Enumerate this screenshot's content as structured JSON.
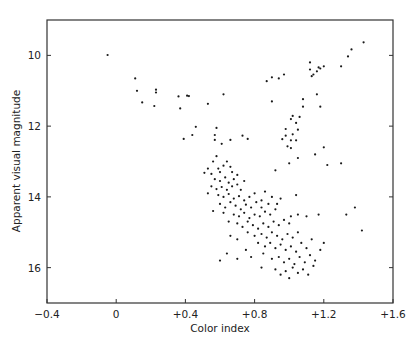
{
  "chart_data": {
    "type": "scatter",
    "title": "",
    "xlabel": "Color index",
    "ylabel": "Apparent visual magnitude",
    "xlim": [
      -0.4,
      1.6
    ],
    "ylim": [
      17.0,
      9.0
    ],
    "y_inverted": true,
    "grid": false,
    "legend": null,
    "x_ticks": [
      -0.4,
      0,
      0.4,
      0.8,
      1.2,
      1.6
    ],
    "x_tick_labels": [
      "−0.4",
      "0",
      "+0.4",
      "+0.8",
      "+1.2",
      "+1.6"
    ],
    "y_ticks": [
      10,
      12,
      14,
      16
    ],
    "y_tick_labels": [
      "10",
      "12",
      "14",
      "16"
    ],
    "marker_color": "#1a1a1a",
    "axis_color": "#333333",
    "points": [
      [
        -0.05,
        9.99
      ],
      [
        0.11,
        10.65
      ],
      [
        0.12,
        11.0
      ],
      [
        0.15,
        11.33
      ],
      [
        0.23,
        10.97
      ],
      [
        0.23,
        11.05
      ],
      [
        0.22,
        11.43
      ],
      [
        0.36,
        11.16
      ],
      [
        0.41,
        11.14
      ],
      [
        0.37,
        11.5
      ],
      [
        0.42,
        11.15
      ],
      [
        0.53,
        11.37
      ],
      [
        0.62,
        11.1
      ],
      [
        0.87,
        10.73
      ],
      [
        0.9,
        10.62
      ],
      [
        0.94,
        10.65
      ],
      [
        0.97,
        10.54
      ],
      [
        0.9,
        11.3
      ],
      [
        0.46,
        12.02
      ],
      [
        0.58,
        12.05
      ],
      [
        0.57,
        12.25
      ],
      [
        0.39,
        12.36
      ],
      [
        0.57,
        12.39
      ],
      [
        0.61,
        12.5
      ],
      [
        0.66,
        12.39
      ],
      [
        0.73,
        12.27
      ],
      [
        0.76,
        12.36
      ],
      [
        0.98,
        12.27
      ],
      [
        1.43,
        9.63
      ],
      [
        1.36,
        9.83
      ],
      [
        1.34,
        10.03
      ],
      [
        1.17,
        10.34
      ],
      [
        1.3,
        10.31
      ],
      [
        1.2,
        10.31
      ],
      [
        1.12,
        10.2
      ],
      [
        1.18,
        10.37
      ],
      [
        1.12,
        10.4
      ],
      [
        1.16,
        10.45
      ],
      [
        1.14,
        10.54
      ],
      [
        1.13,
        10.59
      ],
      [
        1.08,
        11.24
      ],
      [
        1.16,
        11.1
      ],
      [
        1.08,
        11.45
      ],
      [
        1.18,
        11.45
      ],
      [
        1.02,
        11.71
      ],
      [
        1.06,
        11.74
      ],
      [
        1.01,
        11.8
      ],
      [
        1.04,
        11.91
      ],
      [
        0.98,
        12.08
      ],
      [
        1.05,
        12.1
      ],
      [
        1.02,
        12.23
      ],
      [
        0.96,
        12.37
      ],
      [
        1.01,
        12.4
      ],
      [
        1.04,
        12.4
      ],
      [
        0.99,
        12.57
      ],
      [
        1.01,
        12.62
      ],
      [
        1.15,
        12.8
      ],
      [
        1.2,
        12.6
      ],
      [
        1.22,
        13.1
      ],
      [
        1.3,
        13.05
      ],
      [
        1.05,
        12.9
      ],
      [
        1.0,
        13.05
      ],
      [
        0.92,
        13.25
      ],
      [
        0.44,
        12.25
      ],
      [
        0.58,
        12.85
      ],
      [
        0.56,
        13.0
      ],
      [
        0.53,
        13.2
      ],
      [
        0.51,
        13.32
      ],
      [
        0.55,
        13.35
      ],
      [
        0.59,
        13.2
      ],
      [
        0.6,
        13.3
      ],
      [
        0.62,
        13.12
      ],
      [
        0.64,
        13.0
      ],
      [
        0.66,
        13.15
      ],
      [
        0.67,
        13.3
      ],
      [
        0.57,
        13.5
      ],
      [
        0.6,
        13.55
      ],
      [
        0.63,
        13.45
      ],
      [
        0.65,
        13.6
      ],
      [
        0.68,
        13.5
      ],
      [
        0.7,
        13.38
      ],
      [
        0.55,
        13.7
      ],
      [
        0.58,
        13.78
      ],
      [
        0.61,
        13.72
      ],
      [
        0.64,
        13.8
      ],
      [
        0.67,
        13.7
      ],
      [
        0.7,
        13.65
      ],
      [
        0.72,
        13.8
      ],
      [
        0.74,
        13.55
      ],
      [
        0.53,
        13.9
      ],
      [
        0.59,
        13.95
      ],
      [
        0.62,
        14.0
      ],
      [
        0.65,
        13.92
      ],
      [
        0.68,
        14.05
      ],
      [
        0.71,
        13.98
      ],
      [
        0.74,
        14.1
      ],
      [
        0.77,
        14.0
      ],
      [
        0.8,
        13.9
      ],
      [
        0.6,
        14.2
      ],
      [
        0.63,
        14.3
      ],
      [
        0.66,
        14.15
      ],
      [
        0.69,
        14.25
      ],
      [
        0.72,
        14.35
      ],
      [
        0.75,
        14.22
      ],
      [
        0.78,
        14.3
      ],
      [
        0.81,
        14.15
      ],
      [
        0.84,
        14.3
      ],
      [
        0.56,
        14.4
      ],
      [
        0.62,
        14.45
      ],
      [
        0.68,
        14.5
      ],
      [
        0.71,
        14.55
      ],
      [
        0.74,
        14.45
      ],
      [
        0.77,
        14.6
      ],
      [
        0.8,
        14.5
      ],
      [
        0.83,
        14.55
      ],
      [
        0.86,
        14.42
      ],
      [
        0.89,
        14.5
      ],
      [
        0.92,
        14.35
      ],
      [
        0.65,
        14.7
      ],
      [
        0.7,
        14.75
      ],
      [
        0.73,
        14.85
      ],
      [
        0.76,
        14.7
      ],
      [
        0.79,
        14.8
      ],
      [
        0.82,
        14.9
      ],
      [
        0.85,
        14.75
      ],
      [
        0.88,
        14.85
      ],
      [
        0.91,
        14.7
      ],
      [
        0.94,
        14.8
      ],
      [
        0.97,
        14.65
      ],
      [
        1.0,
        14.75
      ],
      [
        0.84,
        14.1
      ],
      [
        0.88,
        14.2
      ],
      [
        0.9,
        14.0
      ],
      [
        0.93,
        14.2
      ],
      [
        0.95,
        14.05
      ],
      [
        1.01,
        14.55
      ],
      [
        1.05,
        14.5
      ],
      [
        1.1,
        14.55
      ],
      [
        1.17,
        14.5
      ],
      [
        1.33,
        14.5
      ],
      [
        1.38,
        14.3
      ],
      [
        1.42,
        14.95
      ],
      [
        1.04,
        13.95
      ],
      [
        0.86,
        13.85
      ],
      [
        0.76,
        15.0
      ],
      [
        0.8,
        15.1
      ],
      [
        0.84,
        15.05
      ],
      [
        0.87,
        15.15
      ],
      [
        0.9,
        15.0
      ],
      [
        0.93,
        15.1
      ],
      [
        0.96,
        15.2
      ],
      [
        0.99,
        15.05
      ],
      [
        1.02,
        15.15
      ],
      [
        1.05,
        15.0
      ],
      [
        0.66,
        15.1
      ],
      [
        0.7,
        15.2
      ],
      [
        0.82,
        15.3
      ],
      [
        0.86,
        15.4
      ],
      [
        0.89,
        15.3
      ],
      [
        0.92,
        15.45
      ],
      [
        0.95,
        15.35
      ],
      [
        0.98,
        15.5
      ],
      [
        1.01,
        15.4
      ],
      [
        1.04,
        15.55
      ],
      [
        1.07,
        15.3
      ],
      [
        1.1,
        15.45
      ],
      [
        1.13,
        15.2
      ],
      [
        0.75,
        15.5
      ],
      [
        0.64,
        15.6
      ],
      [
        0.7,
        15.75
      ],
      [
        0.6,
        15.8
      ],
      [
        0.78,
        15.7
      ],
      [
        0.85,
        15.6
      ],
      [
        0.9,
        15.75
      ],
      [
        0.94,
        15.7
      ],
      [
        0.97,
        15.85
      ],
      [
        1.0,
        15.75
      ],
      [
        1.03,
        15.9
      ],
      [
        1.06,
        15.7
      ],
      [
        1.09,
        15.85
      ],
      [
        1.12,
        15.65
      ],
      [
        1.15,
        15.8
      ],
      [
        0.84,
        16.0
      ],
      [
        0.92,
        16.05
      ],
      [
        0.98,
        16.1
      ],
      [
        1.02,
        16.0
      ],
      [
        1.05,
        16.15
      ],
      [
        1.08,
        16.05
      ],
      [
        1.11,
        16.2
      ],
      [
        1.14,
        15.95
      ],
      [
        1.0,
        16.3
      ],
      [
        0.95,
        16.2
      ],
      [
        1.18,
        15.5
      ],
      [
        1.2,
        15.3
      ]
    ]
  },
  "axes": {
    "xlabel": "Color index",
    "ylabel": "Apparent visual magnitude"
  }
}
